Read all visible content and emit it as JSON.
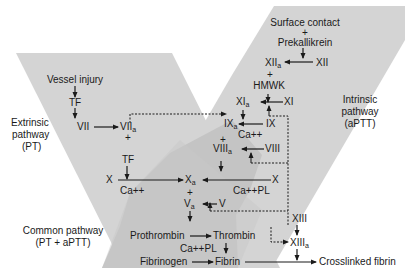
{
  "colors": {
    "background": "#ffffff",
    "pathway_fill": "#d4d4d4",
    "common_fill": "#c2c2c2",
    "text": "#1a1a1a",
    "arrow": "#1a1a1a"
  },
  "regions": {
    "extrinsic": {
      "line1": "Extrinsic",
      "line2": "pathway",
      "line3": "(PT)"
    },
    "intrinsic": {
      "line1": "Intrinsic",
      "line2": "pathway",
      "line3": "(aPTT)"
    },
    "common": {
      "line1": "Common pathway",
      "line2": "(PT + aPTT)"
    }
  },
  "extrinsic_nodes": {
    "vessel_injury": "Vessel injury",
    "tf1": "TF",
    "vii": "VII",
    "viia": "VII",
    "viia_sub": "a",
    "plus1": "+",
    "tf2": "TF",
    "x_left": "X",
    "ca_left": "Ca++"
  },
  "intrinsic_nodes": {
    "surface_contact": "Surface contact",
    "plus_top": "+",
    "prekallikrein": "Prekallikrein",
    "xiia": "XII",
    "xiia_sub": "a",
    "xii": "XII",
    "plus_hmwk": "+",
    "hmwk": "HMWK",
    "xia": "XI",
    "xia_sub": "a",
    "xi": "XI",
    "ixa": "IX",
    "ixa_sub": "a",
    "ix": "IX",
    "ca_ix": "Ca++",
    "plus_viii": "+",
    "viiia": "VIII",
    "viiia_sub": "a",
    "viii": "VIII",
    "x_right": "X",
    "ca_pl_right": "Ca++PL"
  },
  "common_nodes": {
    "xa": "X",
    "xa_sub": "a",
    "plus_va": "+",
    "va": "V",
    "va_sub": "a",
    "v": "V",
    "prothrombin": "Prothrombin",
    "thrombin": "Thrombin",
    "ca_pl_bottom": "Ca++PL",
    "fibrinogen": "Fibrinogen",
    "fibrin": "Fibrin",
    "xiii": "XIII",
    "xiiia": "XIII",
    "xiiia_sub": "a",
    "crosslinked_fibrin": "Crosslinked fibrin"
  }
}
